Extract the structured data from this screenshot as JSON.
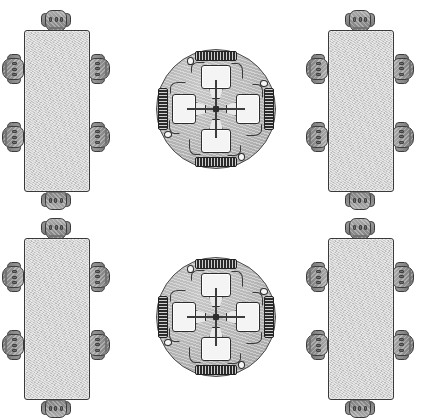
{
  "scene": {
    "title": "Office Furniture Layout",
    "description": "Top-down floor plan showing four furniture groups arranged in a two-by-two grid",
    "background_color": "#ffffff",
    "width": 432,
    "height": 417,
    "grid_rows": 2,
    "grid_columns": 2
  },
  "palette": {
    "table_top": "#cfcfcf",
    "table_outline": "#3a3a3a",
    "round_table_top": "#b4b4b4",
    "round_table_outline": "#4a4a4a",
    "chair_fill": "#8e8e8e",
    "chair_outline": "#3c3c3c",
    "monitor_screen": "#f4f4f4",
    "keyboard_body": "#2b2b2b",
    "cable": "#3a3a3a",
    "hub": "#2e2e2e"
  },
  "groups": [
    {
      "id": "conference-table-top-left",
      "type": "rectangular-conference-table",
      "label": "Rectangular conference table with six chairs",
      "position": {
        "x": 2,
        "y": 14
      },
      "table": {
        "label": "Rectangular table top",
        "width": 64,
        "height": 160,
        "shape": "rectangle"
      },
      "seat_count": 6,
      "chairs": [
        {
          "label": "Chair head of table north",
          "side": "top",
          "index": 1
        },
        {
          "label": "Chair west upper",
          "side": "left",
          "index": 2
        },
        {
          "label": "Chair west lower",
          "side": "left",
          "index": 3
        },
        {
          "label": "Chair east upper",
          "side": "right",
          "index": 4
        },
        {
          "label": "Chair east lower",
          "side": "right",
          "index": 5
        },
        {
          "label": "Chair head of table south",
          "side": "bottom",
          "index": 6
        }
      ]
    },
    {
      "id": "workstation-table-top-center",
      "type": "circular-workstation-table",
      "label": "Round computer table with four workstations",
      "position": {
        "x": 151,
        "y": 44
      },
      "table": {
        "label": "Circular table top",
        "diameter": 120,
        "shape": "circle"
      },
      "leg_spokes": 8,
      "workstation_count": 4,
      "workstations": [
        {
          "label": "Workstation north",
          "rotation_deg": 0,
          "monitor": "Monitor",
          "keyboard": "Keyboard",
          "mouse": "Mouse"
        },
        {
          "label": "Workstation east",
          "rotation_deg": 90,
          "monitor": "Monitor",
          "keyboard": "Keyboard",
          "mouse": "Mouse"
        },
        {
          "label": "Workstation south",
          "rotation_deg": 180,
          "monitor": "Monitor",
          "keyboard": "Keyboard",
          "mouse": "Mouse"
        },
        {
          "label": "Workstation west",
          "rotation_deg": 270,
          "monitor": "Monitor",
          "keyboard": "Keyboard",
          "mouse": "Mouse"
        }
      ]
    },
    {
      "id": "conference-table-top-right",
      "type": "rectangular-conference-table",
      "label": "Rectangular conference table with six chairs",
      "position": {
        "x": 306,
        "y": 14
      },
      "table": {
        "label": "Rectangular table top",
        "width": 64,
        "height": 160,
        "shape": "rectangle"
      },
      "seat_count": 6,
      "chairs": [
        {
          "label": "Chair head of table north",
          "side": "top",
          "index": 1
        },
        {
          "label": "Chair west upper",
          "side": "left",
          "index": 2
        },
        {
          "label": "Chair west lower",
          "side": "left",
          "index": 3
        },
        {
          "label": "Chair east upper",
          "side": "right",
          "index": 4
        },
        {
          "label": "Chair east lower",
          "side": "right",
          "index": 5
        },
        {
          "label": "Chair head of table south",
          "side": "bottom",
          "index": 6
        }
      ]
    },
    {
      "id": "conference-table-bottom-left",
      "type": "rectangular-conference-table",
      "label": "Rectangular conference table with six chairs",
      "position": {
        "x": 2,
        "y": 222
      },
      "table": {
        "label": "Rectangular table top",
        "width": 64,
        "height": 160,
        "shape": "rectangle"
      },
      "seat_count": 6,
      "chairs": [
        {
          "label": "Chair head of table north",
          "side": "top",
          "index": 1
        },
        {
          "label": "Chair west upper",
          "side": "left",
          "index": 2
        },
        {
          "label": "Chair west lower",
          "side": "left",
          "index": 3
        },
        {
          "label": "Chair east upper",
          "side": "right",
          "index": 4
        },
        {
          "label": "Chair east lower",
          "side": "right",
          "index": 5
        },
        {
          "label": "Chair head of table south",
          "side": "bottom",
          "index": 6
        }
      ]
    },
    {
      "id": "workstation-table-bottom-center",
      "type": "circular-workstation-table",
      "label": "Round computer table with four workstations",
      "position": {
        "x": 151,
        "y": 252
      },
      "table": {
        "label": "Circular table top",
        "diameter": 120,
        "shape": "circle"
      },
      "leg_spokes": 8,
      "workstation_count": 4,
      "workstations": [
        {
          "label": "Workstation north",
          "rotation_deg": 0,
          "monitor": "Monitor",
          "keyboard": "Keyboard",
          "mouse": "Mouse"
        },
        {
          "label": "Workstation east",
          "rotation_deg": 90,
          "monitor": "Monitor",
          "keyboard": "Keyboard",
          "mouse": "Mouse"
        },
        {
          "label": "Workstation south",
          "rotation_deg": 180,
          "monitor": "Monitor",
          "keyboard": "Keyboard",
          "mouse": "Mouse"
        },
        {
          "label": "Workstation west",
          "rotation_deg": 270,
          "monitor": "Monitor",
          "keyboard": "Keyboard",
          "mouse": "Mouse"
        }
      ]
    },
    {
      "id": "conference-table-bottom-right",
      "type": "rectangular-conference-table",
      "label": "Rectangular conference table with six chairs",
      "position": {
        "x": 306,
        "y": 222
      },
      "table": {
        "label": "Rectangular table top",
        "width": 64,
        "height": 160,
        "shape": "rectangle"
      },
      "seat_count": 6,
      "chairs": [
        {
          "label": "Chair head of table north",
          "side": "top",
          "index": 1
        },
        {
          "label": "Chair west upper",
          "side": "left",
          "index": 2
        },
        {
          "label": "Chair west lower",
          "side": "left",
          "index": 3
        },
        {
          "label": "Chair east upper",
          "side": "right",
          "index": 4
        },
        {
          "label": "Chair east lower",
          "side": "right",
          "index": 5
        },
        {
          "label": "Chair head of table south",
          "side": "bottom",
          "index": 6
        }
      ]
    }
  ],
  "chair_geometry": {
    "seat_label": "Seat back",
    "left_arm_label": "Left armrest",
    "right_arm_label": "Right armrest",
    "detail_count": 3
  }
}
